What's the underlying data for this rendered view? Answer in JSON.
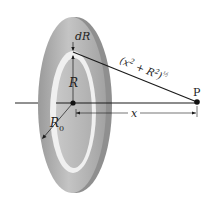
{
  "diagram": {
    "labels": {
      "dR": "dR",
      "R": "R",
      "R0_main": "R",
      "R0_sub": "0",
      "x": "x",
      "P": "P",
      "distance_base": "(x",
      "distance_sq1": "2",
      "distance_plus": " + R",
      "distance_sq2": "2",
      "distance_close": ")",
      "distance_exp": "½"
    },
    "colors": {
      "disk_fill": "#b8b8b8",
      "disk_edge": "#8c8c8c",
      "ring_fill": "#f2f2f2",
      "line": "#1a1a1a",
      "background": "#ffffff"
    }
  }
}
